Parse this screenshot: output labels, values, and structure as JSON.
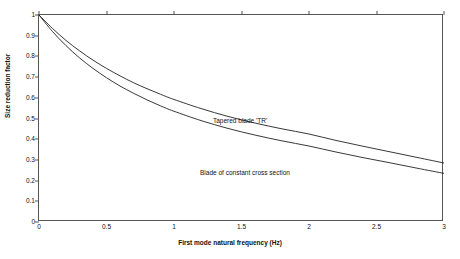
{
  "chart_data": {
    "type": "line",
    "title": "",
    "xlabel": "First mode natural frequency (Hz)",
    "ylabel": "Size reduction factor",
    "xlim": [
      0,
      3
    ],
    "ylim": [
      0,
      1
    ],
    "grid": false,
    "legend_position": "inline-annotations",
    "xticks": [
      "0",
      "0.5",
      "1",
      "1.5",
      "2",
      "2.5",
      "3"
    ],
    "xtick_values": [
      0,
      0.5,
      1,
      1.5,
      2,
      2.5,
      3
    ],
    "yticks": [
      "0",
      "0.1",
      "0.2",
      "0.3",
      "0.4",
      "0.5",
      "0.6",
      "0.7",
      "0.8",
      "0.9",
      "1"
    ],
    "ytick_values": [
      0,
      0.1,
      0.2,
      0.3,
      0.4,
      0.5,
      0.6,
      0.7,
      0.8,
      0.9,
      1
    ],
    "line_color": "#222222",
    "background_color": "#ffffff",
    "axis_color": "#555555",
    "series": [
      {
        "name": "Tapered blade 'TR'",
        "annotation": "Tapered blade 'TR'",
        "x": [
          0,
          0.1,
          0.2,
          0.3,
          0.4,
          0.5,
          0.6,
          0.7,
          0.8,
          0.9,
          1,
          1.2,
          1.4,
          1.6,
          1.8,
          2,
          2.2,
          2.4,
          2.6,
          2.8,
          3
        ],
        "values": [
          1,
          0.935,
          0.877,
          0.827,
          0.782,
          0.742,
          0.706,
          0.673,
          0.644,
          0.617,
          0.592,
          0.548,
          0.51,
          0.478,
          0.45,
          0.425,
          0.394,
          0.366,
          0.339,
          0.312,
          0.285
        ]
      },
      {
        "name": "Blade of constant cross section",
        "annotation": "Blade of constant cross section",
        "x": [
          0,
          0.1,
          0.2,
          0.3,
          0.4,
          0.5,
          0.6,
          0.7,
          0.8,
          0.9,
          1,
          1.2,
          1.4,
          1.6,
          1.8,
          2,
          2.2,
          2.4,
          2.6,
          2.8,
          3
        ],
        "values": [
          1,
          0.92,
          0.852,
          0.793,
          0.742,
          0.697,
          0.657,
          0.622,
          0.59,
          0.561,
          0.535,
          0.49,
          0.452,
          0.42,
          0.392,
          0.367,
          0.338,
          0.311,
          0.286,
          0.26,
          0.235
        ]
      }
    ]
  }
}
